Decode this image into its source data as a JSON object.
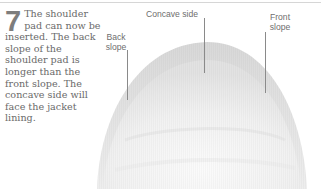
{
  "step": {
    "number": "7",
    "text": "The shoulder pad can now be inserted. The back slope of the shoulder pad is longer than the front slope. The concave side will face the jacket lining."
  },
  "figure": {
    "labels": {
      "back_slope": "Back\nslope",
      "concave_side": "Concave side",
      "front_slope": "Front\nslope"
    }
  },
  "colors": {
    "text": "#6a6a6a",
    "numeral": "#7d7d7d",
    "leader": "#8a8a8a",
    "rule": "#d6d6d6",
    "pad_shadow": "#d9d9d9"
  }
}
